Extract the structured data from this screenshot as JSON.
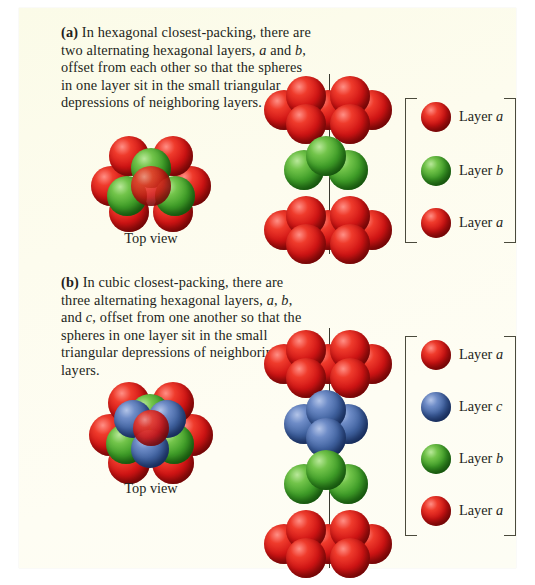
{
  "figure": {
    "background_color": "#fdfcee",
    "panels": [
      {
        "id": "a",
        "label": "(b)",
        "caption_tag": "(a)",
        "caption_text": "In hexagonal closest-packing, there are two alternating hexagonal layers, a and b, offset from each other so that the spheres in one layer sit in the small triangular depressions of neighboring layers.",
        "topview_label": "Top view",
        "legend": [
          {
            "label_prefix": "Layer ",
            "label_letter": "a",
            "color": "#d01414",
            "color_name": "red"
          },
          {
            "label_prefix": "Layer ",
            "label_letter": "b",
            "color": "#3f9d28",
            "color_name": "green"
          },
          {
            "label_prefix": "Layer ",
            "label_letter": "a",
            "color": "#d01414",
            "color_name": "red"
          }
        ],
        "stack_layers": [
          "red",
          "green",
          "red"
        ]
      },
      {
        "id": "b",
        "caption_tag": "(b)",
        "caption_text": "In cubic closest-packing, there are three alternating hexagonal layers, a, b, and c, offset from one another so that the spheres in one layer sit in the small triangular depressions of neighboring layers.",
        "topview_label": "Top view",
        "legend": [
          {
            "label_prefix": "Layer ",
            "label_letter": "a",
            "color": "#d01414",
            "color_name": "red"
          },
          {
            "label_prefix": "Layer ",
            "label_letter": "c",
            "color": "#40629f",
            "color_name": "blue"
          },
          {
            "label_prefix": "Layer ",
            "label_letter": "b",
            "color": "#3f9d28",
            "color_name": "green"
          },
          {
            "label_prefix": "Layer ",
            "label_letter": "a",
            "color": "#d01414",
            "color_name": "red"
          }
        ],
        "stack_layers": [
          "red",
          "blue",
          "green",
          "red"
        ]
      }
    ],
    "colors": {
      "red": "#d01414",
      "green": "#3f9d28",
      "blue": "#40629f",
      "axis": "#3a3a30",
      "bracket": "#4a4a3c",
      "text": "#231f20"
    }
  }
}
